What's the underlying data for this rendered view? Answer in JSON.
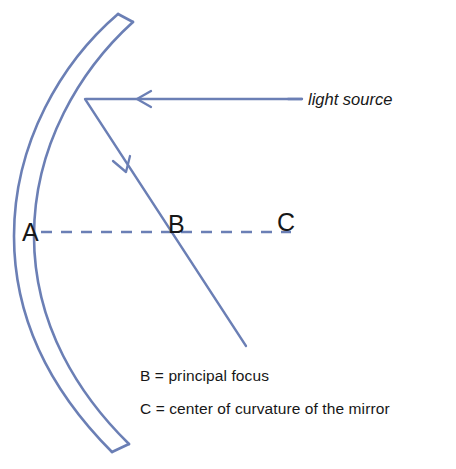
{
  "diagram": {
    "stroke_color": "#6b7fb5",
    "text_color": "#171717",
    "background_color": "#ffffff",
    "points": {
      "a": {
        "label": "A",
        "meaning": "vertex of the mirror"
      },
      "b": {
        "label": "B",
        "meaning": "principal focus"
      },
      "c": {
        "label": "C",
        "meaning": "center of curvature of the mirror"
      }
    },
    "annotations": {
      "light_source": "light source"
    },
    "legend": [
      "B = principal focus",
      "C = center of curvature of the mirror"
    ],
    "elements": {
      "mirror": "concave-mirror-arc",
      "incident_ray": "incident-ray-horizontal",
      "reflected_ray": "reflected-ray",
      "principal_axis": "principal-axis-dashed"
    }
  }
}
